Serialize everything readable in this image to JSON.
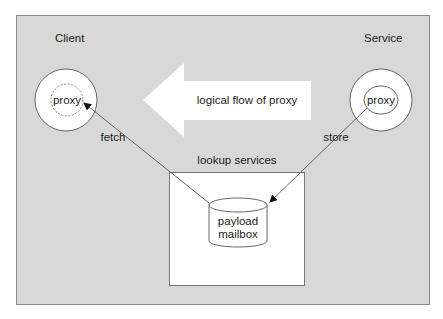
{
  "diagram": {
    "title": "",
    "client": {
      "label": "Client",
      "proxy_label": "proxy"
    },
    "service": {
      "label": "Service",
      "proxy_label": "proxy"
    },
    "flow_arrow": {
      "label": "logical flow of proxy"
    },
    "lookup": {
      "label": "lookup services",
      "mailbox_line1": "payload",
      "mailbox_line2": "mailbox"
    },
    "edges": [
      {
        "from": "lookup-mailbox",
        "to": "client-proxy",
        "label": "fetch"
      },
      {
        "from": "service-proxy",
        "to": "lookup-mailbox",
        "label": "store"
      }
    ],
    "colors": {
      "panel_fill": "#d8d8d8",
      "panel_border": "#8a8a8a",
      "shape_fill": "#ffffff",
      "line": "#555555",
      "text": "#222222"
    }
  }
}
